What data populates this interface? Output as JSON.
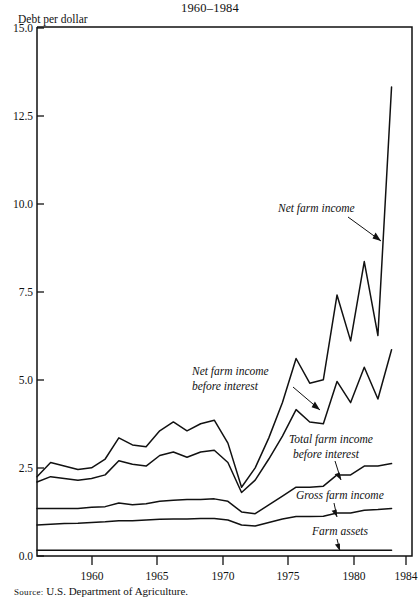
{
  "figure": {
    "title": "1960–1984",
    "y_axis_label": "Debt per dollar",
    "source_prefix": "Source:",
    "source_text": "U.S. Department of Agriculture."
  },
  "chart_data": {
    "type": "line",
    "title": "1960–1984",
    "xlabel": "",
    "ylabel": "Debt per dollar",
    "xlim": [
      1958,
      1985.5
    ],
    "ylim": [
      0.0,
      15.0
    ],
    "grid": false,
    "legend": "annotations-inline",
    "ytick_labels": [
      "0.0",
      "2.5",
      "5.0",
      "7.5",
      "10.0",
      "12.5",
      "15.0"
    ],
    "ytick_values": [
      0.0,
      2.5,
      5.0,
      7.5,
      10.0,
      12.5,
      15.0
    ],
    "xtick_labels": [
      "1960",
      "1965",
      "1970",
      "1975",
      "1980",
      "1984"
    ],
    "xtick_values": [
      1960,
      1965,
      1970,
      1975,
      1980,
      1984
    ],
    "x": [
      1958,
      1959,
      1960,
      1961,
      1962,
      1963,
      1964,
      1965,
      1966,
      1967,
      1968,
      1969,
      1970,
      1971,
      1972,
      1973,
      1974,
      1975,
      1976,
      1977,
      1978,
      1979,
      1980,
      1981,
      1982,
      1983,
      1984
    ],
    "series": [
      {
        "name": "Net farm income",
        "label": "Net farm income",
        "values": [
          2.25,
          2.65,
          2.55,
          2.45,
          2.5,
          2.75,
          3.35,
          3.15,
          3.1,
          3.55,
          3.8,
          3.55,
          3.75,
          3.85,
          3.2,
          1.95,
          2.5,
          3.35,
          4.35,
          5.6,
          4.9,
          5.0,
          7.4,
          6.1,
          8.35,
          6.25,
          13.3
        ]
      },
      {
        "name": "Net farm income before interest",
        "label": "Net farm income\nbefore interest",
        "values": [
          2.1,
          2.25,
          2.2,
          2.15,
          2.2,
          2.3,
          2.7,
          2.6,
          2.55,
          2.85,
          2.95,
          2.8,
          2.95,
          3.0,
          2.65,
          1.8,
          2.15,
          2.75,
          3.4,
          4.15,
          3.8,
          3.75,
          4.95,
          4.35,
          5.35,
          4.45,
          5.85
        ]
      },
      {
        "name": "Total farm income before interest",
        "label": "Total farm income\nbefore interest",
        "values": [
          1.35,
          1.35,
          1.35,
          1.35,
          1.38,
          1.4,
          1.5,
          1.45,
          1.48,
          1.55,
          1.58,
          1.6,
          1.6,
          1.62,
          1.55,
          1.25,
          1.2,
          1.45,
          1.7,
          1.95,
          1.95,
          1.98,
          2.3,
          2.3,
          2.55,
          2.55,
          2.62
        ]
      },
      {
        "name": "Gross farm income",
        "label": "Gross farm income",
        "values": [
          0.88,
          0.9,
          0.92,
          0.93,
          0.95,
          0.97,
          1.0,
          1.0,
          1.02,
          1.04,
          1.05,
          1.05,
          1.06,
          1.06,
          1.02,
          0.88,
          0.85,
          0.95,
          1.05,
          1.12,
          1.12,
          1.13,
          1.22,
          1.22,
          1.3,
          1.32,
          1.35
        ]
      },
      {
        "name": "Farm assets",
        "label": "Farm assets",
        "values": [
          0.16,
          0.16,
          0.16,
          0.16,
          0.16,
          0.16,
          0.16,
          0.16,
          0.16,
          0.16,
          0.16,
          0.16,
          0.16,
          0.16,
          0.16,
          0.16,
          0.16,
          0.16,
          0.16,
          0.16,
          0.16,
          0.16,
          0.16,
          0.16,
          0.16,
          0.16,
          0.16
        ]
      }
    ],
    "annotations": [
      {
        "name": "net-farm-income",
        "lines": [
          "Net farm income"
        ]
      },
      {
        "name": "net-farm-income-before-interest",
        "lines": [
          "Net farm income",
          "before interest"
        ]
      },
      {
        "name": "total-farm-income-before-interest",
        "lines": [
          "Total farm income",
          "before interest"
        ]
      },
      {
        "name": "gross-farm-income",
        "lines": [
          "Gross farm income"
        ]
      },
      {
        "name": "farm-assets",
        "lines": [
          "Farm assets"
        ]
      }
    ]
  }
}
